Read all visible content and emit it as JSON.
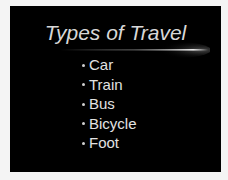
{
  "slide": {
    "title": "Types of Travel",
    "bullets": [
      {
        "label": "Car"
      },
      {
        "label": "Train"
      },
      {
        "label": "Bus"
      },
      {
        "label": "Bicycle"
      },
      {
        "label": "Foot"
      }
    ],
    "background_color": "#000000",
    "text_color": "#e2e2e2"
  }
}
